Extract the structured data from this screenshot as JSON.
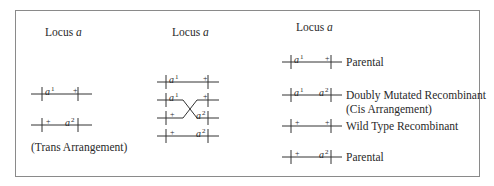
{
  "figure": {
    "border_color": "#8a8a8a",
    "line_color": "#333333",
    "panels": [
      {
        "id": "trans",
        "heading": "Locus a",
        "heading_prefix": "Locus",
        "heading_var": "a",
        "chromosomes": [
          {
            "left": {
              "allele": "a",
              "sup": "1"
            },
            "right": {
              "allele": "+",
              "sup": ""
            }
          },
          {
            "left": {
              "allele": "+",
              "sup": ""
            },
            "right": {
              "allele": "a",
              "sup": "2"
            }
          }
        ],
        "caption": "(Trans Arrangement)"
      },
      {
        "id": "crossover",
        "heading": "Locus a",
        "heading_prefix": "Locus",
        "heading_var": "a",
        "chromosomes": [
          {
            "left": {
              "allele": "a",
              "sup": "1"
            },
            "right": {
              "allele": "+",
              "sup": ""
            }
          },
          {
            "left": {
              "allele": "a",
              "sup": "1"
            },
            "right": {
              "allele": "+",
              "sup": ""
            }
          },
          {
            "left": {
              "allele": "+",
              "sup": ""
            },
            "right": {
              "allele": "a",
              "sup": "2"
            }
          },
          {
            "left": {
              "allele": "+",
              "sup": ""
            },
            "right": {
              "allele": "a",
              "sup": "2"
            }
          }
        ],
        "crossover_between": [
          2,
          3
        ]
      },
      {
        "id": "products",
        "heading": "Locus a",
        "heading_prefix": "Locus",
        "heading_var": "a",
        "chromosomes": [
          {
            "left": {
              "allele": "a",
              "sup": "1"
            },
            "right": {
              "allele": "+",
              "sup": ""
            },
            "label": "Parental",
            "label2": ""
          },
          {
            "left": {
              "allele": "a",
              "sup": "1"
            },
            "right": {
              "allele": "a",
              "sup": "2"
            },
            "label": "Doubly Mutated Recombinant",
            "label2": "(Cis Arrangement)"
          },
          {
            "left": {
              "allele": "+",
              "sup": ""
            },
            "right": {
              "allele": "+",
              "sup": ""
            },
            "label": "Wild Type Recombinant",
            "label2": ""
          },
          {
            "left": {
              "allele": "+",
              "sup": ""
            },
            "right": {
              "allele": "a",
              "sup": "2"
            },
            "label": "Parental",
            "label2": ""
          }
        ]
      }
    ]
  }
}
